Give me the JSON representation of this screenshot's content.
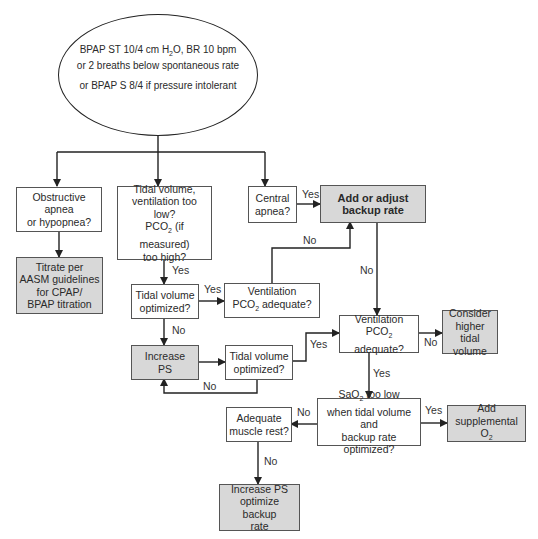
{
  "start": {
    "line1_pre": "BPAP ST 10/4 cm H",
    "line1_sub": "2",
    "line1_post": "O, BR 10 bpm",
    "line2": "or 2 breaths below spontaneous rate",
    "line3": "or BPAP S 8/4 if pressure intolerant"
  },
  "nodes": {
    "obstructive": {
      "l1": "Obstructive apnea",
      "l2": "or hypopnea?"
    },
    "titrate": {
      "l1": "Titrate per",
      "l2": "AASM guidelines",
      "l3": "for CPAP/",
      "l4": "BPAP titration"
    },
    "tidal_low": {
      "l1": "Tidal volume,",
      "l2": "ventilation too low?",
      "l3_pre": "PCO",
      "l3_sub": "2",
      "l3_post": " (if measured)",
      "l4": "too high?"
    },
    "central": {
      "l1": "Central",
      "l2": "apnea?"
    },
    "backup": {
      "l1": "Add or adjust",
      "l2": "backup rate"
    },
    "tv_opt1": {
      "l1": "Tidal volume",
      "l2": "optimized?"
    },
    "vent_left": {
      "l1": "Ventilation",
      "l2_pre": "PCO",
      "l2_sub": "2",
      "l2_post": " adequate?"
    },
    "increase_ps": {
      "l1": "Increase",
      "l2": "PS"
    },
    "tv_opt2": {
      "l1": "Tidal volume",
      "l2": "optimized?"
    },
    "vent_right": {
      "l1": "Ventilation",
      "l2_pre": "PCO",
      "l2_sub": "2",
      "l2_post": " adequate?"
    },
    "consider": {
      "l1": "Consider",
      "l2": "higher tidal",
      "l3": "volume"
    },
    "sao2": {
      "l1_pre": "SaO",
      "l1_sub": "2",
      "l1_post": " too low",
      "l2": "when tidal volume and",
      "l3": "backup rate optimized?"
    },
    "supp_o2": {
      "l1": "Add",
      "l2_pre": "supplemental O",
      "l2_sub": "2"
    },
    "muscle": {
      "l1": "Adequate",
      "l2": "muscle rest?"
    },
    "increase_ps2": {
      "l1": "Increase PS",
      "l2": "optimize backup",
      "l3": "rate"
    }
  },
  "edge_labels": {
    "yes_central": "Yes",
    "yes_tidal_low": "Yes",
    "yes_tv_opt1": "Yes",
    "no_tv_opt1": "No",
    "no_vent_left": "No",
    "no_backup": "No",
    "yes_tv_opt2": "Yes",
    "no_tv_opt2": "No",
    "no_vent_right": "No",
    "yes_vent_right": "Yes",
    "yes_sao2": "Yes",
    "no_sao2": "No",
    "no_muscle": "No"
  },
  "colors": {
    "action_fill": "#d8d8d8",
    "line": "#222222"
  }
}
